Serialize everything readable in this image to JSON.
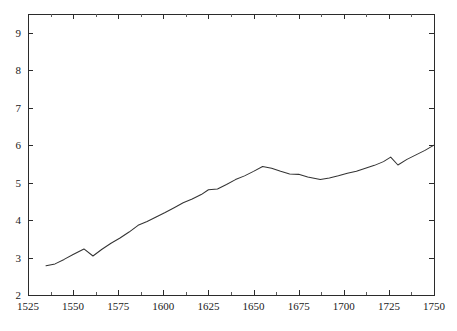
{
  "chart_data": {
    "type": "line",
    "title": "",
    "subtitle": "",
    "xlabel": "",
    "ylabel": "",
    "xlim": [
      1525,
      1750
    ],
    "ylim": [
      2,
      9.5
    ],
    "grid": false,
    "legend": null,
    "legend_position": "none",
    "x_ticks": [
      1525,
      1550,
      1575,
      1600,
      1625,
      1650,
      1675,
      1700,
      1725,
      1750
    ],
    "x_tick_labels": [
      "1525",
      "1550",
      "1575",
      "1600",
      "1625",
      "1650",
      "1675",
      "1700",
      "1725",
      "1750"
    ],
    "x_minor_tick_interval": 12.5,
    "y_ticks": [
      2,
      3,
      4,
      5,
      6,
      7,
      8,
      9
    ],
    "y_tick_labels": [
      "2",
      "3",
      "4",
      "5",
      "6",
      "7",
      "8",
      "9"
    ],
    "y_minor_ticks": false,
    "line_color": "#333333",
    "line_width": 1.05,
    "background_color": "#ffffff",
    "axis_color": "#2b2b2b",
    "series": [
      {
        "name": "series-1",
        "x": [
          1535,
          1540,
          1545,
          1550,
          1556,
          1561,
          1566,
          1571,
          1576,
          1581,
          1586,
          1591,
          1596,
          1601,
          1606,
          1611,
          1616,
          1621,
          1625,
          1630,
          1635,
          1640,
          1645,
          1650,
          1655,
          1660,
          1665,
          1670,
          1675,
          1680,
          1687,
          1692,
          1697,
          1702,
          1707,
          1712,
          1717,
          1722,
          1726,
          1730,
          1735,
          1740,
          1745,
          1750
        ],
        "y": [
          2.78,
          2.83,
          2.95,
          3.08,
          3.23,
          3.04,
          3.22,
          3.38,
          3.52,
          3.68,
          3.86,
          3.96,
          4.08,
          4.2,
          4.33,
          4.46,
          4.56,
          4.68,
          4.81,
          4.83,
          4.95,
          5.08,
          5.18,
          5.3,
          5.43,
          5.38,
          5.3,
          5.23,
          5.22,
          5.15,
          5.08,
          5.12,
          5.18,
          5.25,
          5.3,
          5.38,
          5.46,
          5.56,
          5.68,
          5.47,
          5.62,
          5.74,
          5.86,
          6.0
        ]
      }
    ]
  },
  "plot_geometry": {
    "left": 28,
    "top": 14,
    "right": 434,
    "bottom": 295
  }
}
